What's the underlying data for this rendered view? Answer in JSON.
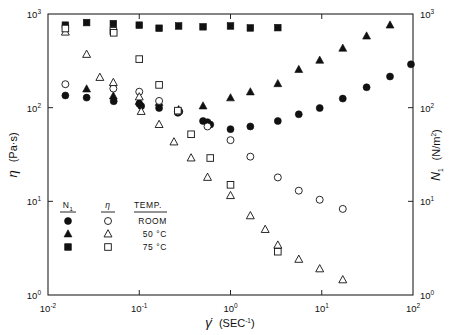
{
  "chart_data": {
    "type": "scatter",
    "title": "",
    "xlabel": "γ̇  (SEC⁻¹)",
    "ylabel_left": "η  (Pa·s)",
    "ylabel_right": "N₁  (N/m²)",
    "xscale": "log",
    "yscale": "log",
    "xlim": [
      0.01,
      100
    ],
    "ylim": [
      1,
      1000
    ],
    "xticks": [
      "10⁻²",
      "10⁻¹",
      "10⁰",
      "10¹",
      "10²"
    ],
    "xtick_values": [
      0.01,
      0.1,
      1,
      10,
      100
    ],
    "yticks": [
      "10⁰",
      "10¹",
      "10²",
      "10³"
    ],
    "ytick_values": [
      1,
      10,
      100,
      1000
    ],
    "grid": false,
    "legend_position": "lower-left-inside",
    "legend": {
      "headers": [
        "N₁",
        "η",
        "TEMP."
      ],
      "rows": [
        {
          "n1_marker": "filled-circle",
          "eta_marker": "open-circle",
          "temp": "ROOM"
        },
        {
          "n1_marker": "filled-triangle",
          "eta_marker": "open-triangle",
          "temp": "50 °C"
        },
        {
          "n1_marker": "filled-square",
          "eta_marker": "open-square",
          "temp": "75 °C"
        }
      ]
    },
    "series": [
      {
        "name": "N1 ROOM",
        "marker": "filled-circle",
        "axis": "right",
        "points": [
          [
            0.0155,
            135
          ],
          [
            0.0265,
            128
          ],
          [
            0.0525,
            117
          ],
          [
            0.1,
            110
          ],
          [
            0.105,
            104
          ],
          [
            0.165,
            99
          ],
          [
            0.265,
            88
          ],
          [
            0.275,
            91
          ],
          [
            0.5,
            72
          ],
          [
            0.56,
            70
          ],
          [
            0.6,
            66
          ],
          [
            1.0,
            59
          ],
          [
            1.65,
            63
          ],
          [
            3.3,
            72
          ],
          [
            5.6,
            85
          ],
          [
            9.5,
            99
          ],
          [
            17,
            125
          ],
          [
            31,
            165
          ],
          [
            56,
            215
          ],
          [
            95,
            290
          ]
        ]
      },
      {
        "name": "N1 50C",
        "marker": "filled-triangle",
        "axis": "right",
        "points": [
          [
            0.0265,
            158
          ],
          [
            0.052,
            133
          ],
          [
            0.1,
            116
          ],
          [
            0.165,
            113
          ],
          [
            0.27,
            95
          ],
          [
            0.5,
            104
          ],
          [
            1.0,
            127
          ],
          [
            1.65,
            147
          ],
          [
            3.3,
            180
          ],
          [
            5.6,
            255
          ],
          [
            9.5,
            320
          ],
          [
            17,
            430
          ],
          [
            31,
            580
          ],
          [
            56,
            760
          ]
        ]
      },
      {
        "name": "N1 75C",
        "marker": "filled-square",
        "axis": "right",
        "points": [
          [
            0.0155,
            760
          ],
          [
            0.0265,
            810
          ],
          [
            0.052,
            790
          ],
          [
            0.1,
            760
          ],
          [
            0.165,
            705
          ],
          [
            0.27,
            745
          ],
          [
            0.5,
            730
          ],
          [
            1.0,
            745
          ],
          [
            1.65,
            710
          ],
          [
            3.3,
            715
          ]
        ]
      },
      {
        "name": "eta ROOM",
        "marker": "open-circle",
        "axis": "left",
        "points": [
          [
            0.0155,
            178
          ],
          [
            0.052,
            160
          ],
          [
            0.1,
            148
          ],
          [
            0.165,
            118
          ],
          [
            0.265,
            91
          ],
          [
            0.56,
            63
          ],
          [
            1.0,
            45
          ],
          [
            1.65,
            30
          ],
          [
            3.3,
            18
          ],
          [
            5.6,
            13
          ],
          [
            9.5,
            10.4
          ],
          [
            17,
            8.3
          ]
        ]
      },
      {
        "name": "eta 50C",
        "marker": "open-triangle",
        "axis": "left",
        "points": [
          [
            0.0155,
            640
          ],
          [
            0.0265,
            370
          ],
          [
            0.037,
            210
          ],
          [
            0.052,
            185
          ],
          [
            0.1,
            130
          ],
          [
            0.105,
            91
          ],
          [
            0.165,
            66
          ],
          [
            0.24,
            43
          ],
          [
            0.37,
            29
          ],
          [
            0.56,
            18
          ],
          [
            1.0,
            11.5
          ],
          [
            1.65,
            7.0
          ],
          [
            2.4,
            5.0
          ],
          [
            3.3,
            3.4
          ],
          [
            5.6,
            2.4
          ],
          [
            9.5,
            1.9
          ],
          [
            17,
            1.45
          ]
        ]
      },
      {
        "name": "eta 75C",
        "marker": "open-square",
        "axis": "left",
        "points": [
          [
            0.0155,
            700
          ],
          [
            0.052,
            660
          ],
          [
            0.0525,
            630
          ],
          [
            0.1,
            330
          ],
          [
            0.165,
            175
          ],
          [
            0.265,
            93
          ],
          [
            0.37,
            52
          ],
          [
            0.6,
            29
          ],
          [
            1.0,
            15
          ],
          [
            3.3,
            2.9
          ]
        ]
      }
    ]
  }
}
